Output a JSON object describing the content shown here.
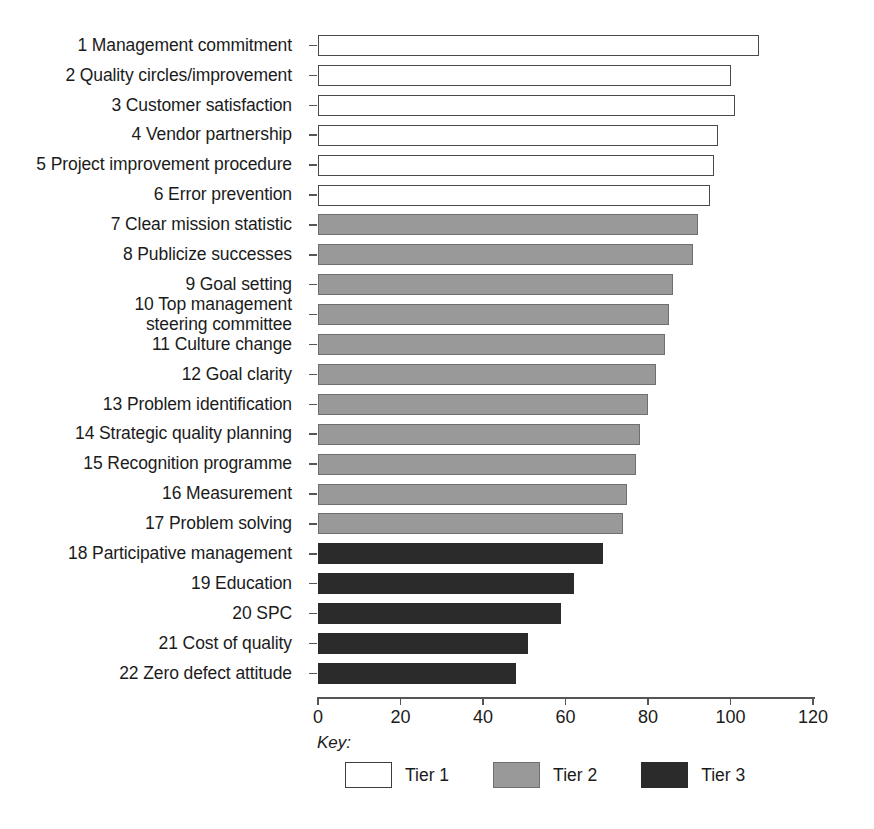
{
  "chart_data": {
    "type": "bar",
    "orientation": "horizontal",
    "title": "",
    "xlabel": "",
    "ylabel": "",
    "xlim": [
      0,
      120
    ],
    "xticks": [
      0,
      20,
      40,
      60,
      80,
      100,
      120
    ],
    "grid": false,
    "legend_position": "bottom",
    "legend_title": "Key:",
    "series": [
      {
        "name": "Tier 1",
        "color": "#ffffff",
        "edge_color": "#4a4a4a"
      },
      {
        "name": "Tier 2",
        "color": "#999999",
        "edge_color": "#6f6f6f"
      },
      {
        "name": "Tier 3",
        "color": "#2b2b2b",
        "edge_color": "#2b2b2b"
      }
    ],
    "categories": [
      "1 Management commitment",
      "2 Quality circles/improvement",
      "3 Customer satisfaction",
      "4 Vendor partnership",
      "5 Project improvement procedure",
      "6 Error prevention",
      "7 Clear mission statistic",
      "8 Publicize successes",
      "9 Goal setting",
      "10 Top management\nsteering committee",
      "11 Culture change",
      "12 Goal clarity",
      "13 Problem identification",
      "14 Strategic quality planning",
      "15 Recognition programme",
      "16 Measurement",
      "17 Problem solving",
      "18 Participative management",
      "19 Education",
      "20 SPC",
      "21 Cost of quality",
      "22 Zero defect attitude"
    ],
    "values": [
      107,
      100,
      101,
      97,
      96,
      95,
      92,
      91,
      86,
      85,
      84,
      82,
      80,
      78,
      77,
      75,
      74,
      69,
      62,
      59,
      51,
      48
    ],
    "tiers": [
      "Tier 1",
      "Tier 1",
      "Tier 1",
      "Tier 1",
      "Tier 1",
      "Tier 1",
      "Tier 2",
      "Tier 2",
      "Tier 2",
      "Tier 2",
      "Tier 2",
      "Tier 2",
      "Tier 2",
      "Tier 2",
      "Tier 2",
      "Tier 2",
      "Tier 2",
      "Tier 3",
      "Tier 3",
      "Tier 3",
      "Tier 3",
      "Tier 3"
    ]
  },
  "axis": {
    "tick_labels": [
      "0",
      "20",
      "40",
      "60",
      "80",
      "100",
      "120"
    ]
  },
  "key": {
    "title": "Key:",
    "items": [
      {
        "label": "Tier 1",
        "tier_class": "tier1"
      },
      {
        "label": "Tier 2",
        "tier_class": "tier2"
      },
      {
        "label": "Tier 3",
        "tier_class": "tier3"
      }
    ]
  }
}
